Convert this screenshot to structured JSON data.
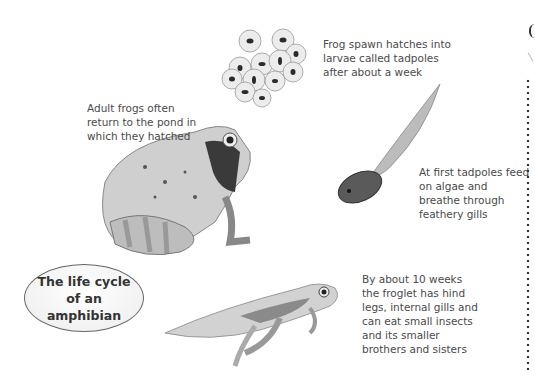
{
  "title": "The life cycle of an amphibian",
  "captions": {
    "spawn": "Frog spawn hatches into larvae called tadpoles after about a week",
    "adult": "Adult frogs often return to the pond in which they hatched",
    "tadpole": "At first tadpoles feed on algae and breathe through feathery gills",
    "froglet": "By about 10 weeks the froglet has hind legs, internal gills and can eat small insects and its smaller brothers and sisters"
  },
  "illustrations": [
    "frog-spawn",
    "adult-frog",
    "tadpole",
    "froglet"
  ]
}
